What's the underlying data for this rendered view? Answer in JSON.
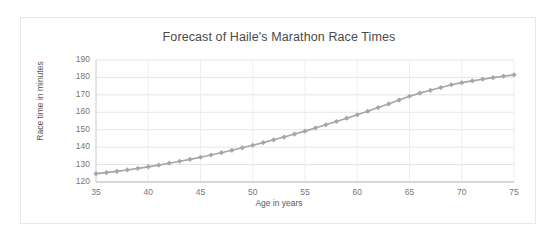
{
  "chart_data": {
    "type": "line",
    "title": "Forecast of Haile's Marathon Race Times",
    "xlabel": "Age in years",
    "ylabel": "Race time in minutes",
    "xlim": [
      35,
      75
    ],
    "ylim": [
      120,
      190
    ],
    "xticks": [
      35,
      40,
      45,
      50,
      55,
      60,
      65,
      70,
      75
    ],
    "yticks": [
      120,
      130,
      140,
      150,
      160,
      170,
      180,
      190
    ],
    "grid": true,
    "legend": false,
    "marker": "diamond",
    "series_color": "#a6a6a6",
    "x": [
      35,
      36,
      37,
      38,
      39,
      40,
      41,
      42,
      43,
      44,
      45,
      46,
      47,
      48,
      49,
      50,
      51,
      52,
      53,
      54,
      55,
      56,
      57,
      58,
      59,
      60,
      61,
      62,
      63,
      64,
      65,
      66,
      67,
      68,
      69,
      70,
      71,
      72,
      73,
      74,
      75
    ],
    "values": [
      124.8,
      125.4,
      126.1,
      126.9,
      127.8,
      128.7,
      129.7,
      130.8,
      131.9,
      133.0,
      134.2,
      135.5,
      136.8,
      138.2,
      139.6,
      141.1,
      142.6,
      144.2,
      145.8,
      147.5,
      149.2,
      151.0,
      152.8,
      154.7,
      156.6,
      158.6,
      160.6,
      162.7,
      164.8,
      167.0,
      169.2,
      171.0,
      172.6,
      174.2,
      175.8,
      177.0,
      178.0,
      179.0,
      179.9,
      180.7,
      181.5
    ]
  }
}
